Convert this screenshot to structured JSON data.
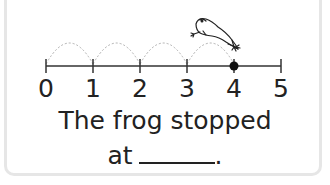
{
  "number_line": {
    "ticks": [
      "0",
      "1",
      "2",
      "3",
      "4",
      "5"
    ],
    "jumps": 4,
    "start": 0,
    "end_point": 4,
    "highlighted_point_label": "4"
  },
  "frog": {
    "icon": "frog-icon"
  },
  "question": {
    "line1": "The frog stopped",
    "line2_prefix": "at",
    "line2_suffix": "."
  },
  "colors": {
    "border": "#e6e6e6",
    "line": "#333333",
    "arc": "#b0b0b0",
    "text": "#222222"
  }
}
